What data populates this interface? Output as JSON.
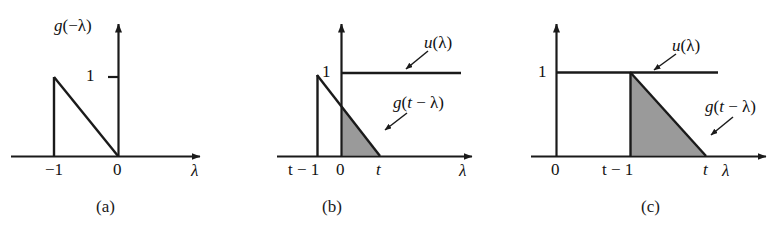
{
  "figure": {
    "background": "#ffffff",
    "line_color": "#1a1a1a",
    "shade_color": "#9a9a9a",
    "width": 781,
    "height": 236
  },
  "chart_data": {
    "type": "line",
    "xlabel": "λ",
    "ylabel": "",
    "grid": false,
    "legend": "none",
    "panels": [
      {
        "id": "a",
        "caption": "(a)",
        "ylabel": "g(−λ)",
        "xlabel": "λ",
        "xticks": [
          "−1",
          "0"
        ],
        "xtick_values": [
          -1,
          0
        ],
        "yticks": [
          "1"
        ],
        "ytick_values": [
          1
        ],
        "xlim": [
          -1.55,
          1.35
        ],
        "ylim": [
          0,
          1.3
        ],
        "series": [
          {
            "name": "g(-lambda)",
            "type": "line",
            "points": [
              [
                -1,
                0
              ],
              [
                -1,
                1
              ],
              [
                0,
                0
              ],
              [
                0,
                0
              ]
            ],
            "shaded": false
          }
        ],
        "annotations": []
      },
      {
        "id": "b",
        "caption": "(b)",
        "ylabel": "",
        "xlabel": "λ",
        "xticks": [
          "t − 1",
          "0",
          "t"
        ],
        "xtick_values": [
          -0.38,
          0,
          0.6
        ],
        "yticks": [
          "1"
        ],
        "ytick_values": [
          1
        ],
        "xlim": [
          -0.62,
          2.15
        ],
        "ylim": [
          0,
          1.3
        ],
        "series": [
          {
            "name": "u(lambda)",
            "type": "step",
            "points": [
              [
                0,
                1
              ],
              [
                1.9,
                1
              ]
            ],
            "shaded": false
          },
          {
            "name": "g(t-lambda)",
            "type": "line",
            "points": [
              [
                -0.38,
                0
              ],
              [
                -0.38,
                1
              ],
              [
                0.6,
                0
              ]
            ],
            "shaded": false
          },
          {
            "name": "overlap-area",
            "type": "area",
            "points": [
              [
                0,
                0
              ],
              [
                0,
                0.615
              ],
              [
                0.6,
                0
              ]
            ],
            "shaded": true
          }
        ],
        "annotations": [
          {
            "text": "u(λ)",
            "target": "u-step-line"
          },
          {
            "text": "g(t − λ)",
            "target": "g-ramp-edge"
          }
        ]
      },
      {
        "id": "c",
        "caption": "(c)",
        "ylabel": "",
        "xlabel": "λ",
        "xticks": [
          "0",
          "t − 1",
          "t"
        ],
        "xtick_values": [
          0,
          0.92,
          1.86
        ],
        "yticks": [
          "1"
        ],
        "ytick_values": [
          1
        ],
        "xlim": [
          -0.2,
          2.4
        ],
        "ylim": [
          0,
          1.3
        ],
        "series": [
          {
            "name": "u(lambda)",
            "type": "step",
            "points": [
              [
                0,
                1
              ],
              [
                2.02,
                1
              ]
            ],
            "shaded": false
          },
          {
            "name": "g(t-lambda)",
            "type": "line",
            "points": [
              [
                0.92,
                0
              ],
              [
                0.92,
                1
              ],
              [
                1.86,
                0
              ]
            ],
            "shaded": false
          },
          {
            "name": "overlap-area",
            "type": "area",
            "points": [
              [
                0.92,
                0
              ],
              [
                0.92,
                1
              ],
              [
                1.86,
                0
              ]
            ],
            "shaded": true
          }
        ],
        "annotations": [
          {
            "text": "u(λ)",
            "target": "u-step-line"
          },
          {
            "text": "g(t − λ)",
            "target": "g-ramp-edge"
          }
        ]
      }
    ]
  },
  "panel_a": {
    "y_axis_label": "g(−λ)",
    "y_tick_1": "1",
    "x_tick_minus1": "−1",
    "x_tick_0": "0",
    "x_axis_label": "λ",
    "caption": "(a)"
  },
  "panel_b": {
    "y_tick_1": "1",
    "x_tick_tminus1": "t − 1",
    "x_tick_0": "0",
    "x_tick_t": "t",
    "x_axis_label": "λ",
    "label_u": "u(λ)",
    "label_g": "g(t − λ)",
    "caption": "(b)"
  },
  "panel_c": {
    "y_tick_1": "1",
    "x_tick_0": "0",
    "x_tick_tminus1": "t − 1",
    "x_tick_t": "t",
    "x_axis_label": "λ",
    "label_u": "u(λ)",
    "label_g": "g(t − λ)",
    "caption": "(c)"
  }
}
